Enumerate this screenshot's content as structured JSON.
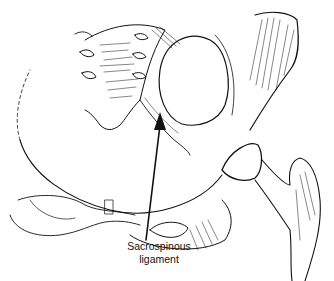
{
  "figure": {
    "label_line1": "Sacrospinous",
    "label_line2": "ligament",
    "colors": {
      "ink": "#111111",
      "background": "#ffffff"
    }
  }
}
